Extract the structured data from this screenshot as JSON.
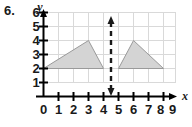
{
  "figure": {
    "problem_number": "6.",
    "axes": {
      "x_label": "x",
      "y_label": "y",
      "x_ticks": [
        "0",
        "1",
        "2",
        "3",
        "4",
        "5",
        "6",
        "7",
        "8",
        "9"
      ],
      "y_ticks": [
        "1",
        "2",
        "3",
        "4",
        "5",
        "6"
      ],
      "x_range": [
        0,
        9
      ],
      "y_range": [
        0,
        6
      ],
      "grid": true,
      "grid_color": "#d9d9d9",
      "axis_color": "#000000"
    },
    "shapes": [
      {
        "name": "left-triangle",
        "type": "polygon",
        "vertices": [
          [
            0,
            2
          ],
          [
            3,
            4
          ],
          [
            4,
            2
          ]
        ],
        "fill": "#d4d4d4",
        "stroke": "#9a9a9a"
      },
      {
        "name": "right-triangle",
        "type": "polygon",
        "vertices": [
          [
            9,
            2
          ],
          [
            6,
            4
          ],
          [
            5,
            2
          ]
        ],
        "fill": "#d4d4d4",
        "stroke": "#9a9a9a"
      }
    ],
    "line_of_reflection": {
      "name": "line-of-reflection",
      "type": "vertical-dashed-double-arrow",
      "x": 4.5,
      "y_from": 0.15,
      "y_to": 6.5,
      "color": "#1a1a1a"
    }
  }
}
